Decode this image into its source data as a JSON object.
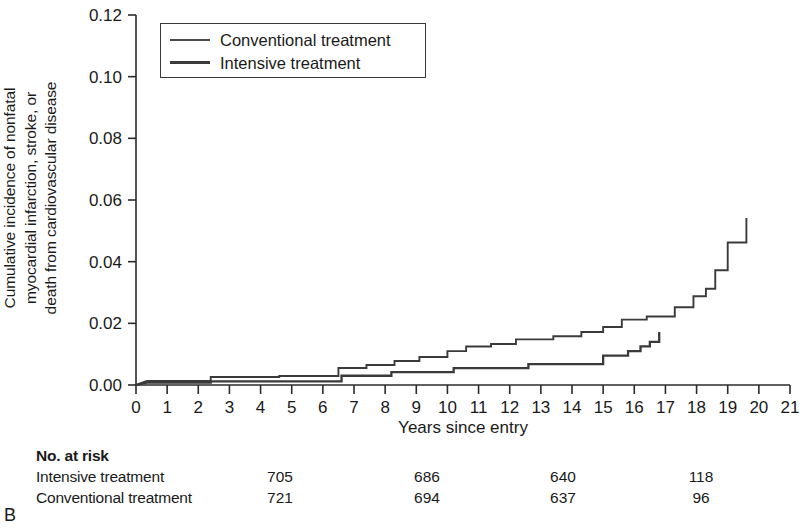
{
  "panel_label": "B",
  "axis": {
    "y_title_lines": [
      "Cumulative incidence of nonfatal",
      "myocardial infarction, stroke, or",
      "death from cardiovascular disease"
    ],
    "x_title": "Years since entry",
    "y_ticks": [
      "0.00",
      "0.02",
      "0.04",
      "0.06",
      "0.08",
      "0.10",
      "0.12"
    ],
    "x_ticks": [
      "0",
      "1",
      "2",
      "3",
      "4",
      "5",
      "6",
      "7",
      "8",
      "9",
      "10",
      "11",
      "12",
      "13",
      "14",
      "15",
      "16",
      "17",
      "18",
      "19",
      "20",
      "21"
    ]
  },
  "legend": {
    "items": [
      {
        "label": "Conventional treatment",
        "style": "thin",
        "color": "#4a4a4a"
      },
      {
        "label": "Intensive treatment",
        "style": "thick",
        "color": "#3a3a3a"
      }
    ]
  },
  "risk_table": {
    "title": "No. at risk",
    "rows": [
      {
        "name": "Intensive treatment",
        "values": [
          "705",
          "686",
          "640",
          "118"
        ]
      },
      {
        "name": "Conventional treatment",
        "values": [
          "721",
          "694",
          "637",
          "96"
        ]
      }
    ],
    "value_x": [
      280,
      427,
      563,
      701
    ]
  },
  "chart_data": {
    "type": "line",
    "subtype": "kaplan-meier-cumulative-incidence-step",
    "title": "",
    "xlabel": "Years since entry",
    "ylabel": "Cumulative incidence of nonfatal myocardial infarction, stroke, or death from cardiovascular disease",
    "xlim": [
      0,
      21
    ],
    "ylim": [
      0.0,
      0.12
    ],
    "xticks": [
      0,
      1,
      2,
      3,
      4,
      5,
      6,
      7,
      8,
      9,
      10,
      11,
      12,
      13,
      14,
      15,
      16,
      17,
      18,
      19,
      20,
      21
    ],
    "yticks": [
      0.0,
      0.02,
      0.04,
      0.06,
      0.08,
      0.1,
      0.12
    ],
    "grid": false,
    "legend_position": "top-left-inside-box",
    "series": [
      {
        "name": "Conventional treatment",
        "color": "#4a4a4a",
        "linewidth": 1.9,
        "points": [
          [
            0.0,
            0.0
          ],
          [
            0.35,
            0.0013
          ],
          [
            2.4,
            0.0013
          ],
          [
            2.4,
            0.0026
          ],
          [
            4.6,
            0.0026
          ],
          [
            4.6,
            0.0029
          ],
          [
            6.5,
            0.0029
          ],
          [
            6.5,
            0.0055
          ],
          [
            7.4,
            0.0055
          ],
          [
            7.4,
            0.0065
          ],
          [
            8.3,
            0.0065
          ],
          [
            8.3,
            0.0078
          ],
          [
            9.1,
            0.0078
          ],
          [
            9.1,
            0.0091
          ],
          [
            10.0,
            0.0091
          ],
          [
            10.0,
            0.011
          ],
          [
            10.6,
            0.011
          ],
          [
            10.6,
            0.0125
          ],
          [
            11.4,
            0.0125
          ],
          [
            11.4,
            0.0133
          ],
          [
            12.2,
            0.0133
          ],
          [
            12.2,
            0.0148
          ],
          [
            13.4,
            0.0148
          ],
          [
            13.4,
            0.0158
          ],
          [
            14.3,
            0.0158
          ],
          [
            14.3,
            0.0172
          ],
          [
            15.0,
            0.0172
          ],
          [
            15.0,
            0.0188
          ],
          [
            15.6,
            0.0188
          ],
          [
            15.6,
            0.0212
          ],
          [
            16.4,
            0.0212
          ],
          [
            16.4,
            0.0222
          ],
          [
            17.3,
            0.0222
          ],
          [
            17.3,
            0.0252
          ],
          [
            17.9,
            0.0252
          ],
          [
            17.9,
            0.0288
          ],
          [
            18.3,
            0.0288
          ],
          [
            18.3,
            0.0312
          ],
          [
            18.6,
            0.0312
          ],
          [
            18.6,
            0.0372
          ],
          [
            19.0,
            0.0372
          ],
          [
            19.0,
            0.0462
          ],
          [
            19.6,
            0.0462
          ],
          [
            19.6,
            0.0542
          ]
        ]
      },
      {
        "name": "Intensive treatment",
        "color": "#3a3a3a",
        "linewidth": 2.3,
        "points": [
          [
            0.0,
            0.0
          ],
          [
            0.35,
            0.0008
          ],
          [
            2.4,
            0.0008
          ],
          [
            2.4,
            0.0012
          ],
          [
            6.6,
            0.0012
          ],
          [
            6.6,
            0.003
          ],
          [
            8.2,
            0.003
          ],
          [
            8.2,
            0.0042
          ],
          [
            10.2,
            0.0042
          ],
          [
            10.2,
            0.0055
          ],
          [
            12.6,
            0.0055
          ],
          [
            12.6,
            0.0068
          ],
          [
            15.0,
            0.0068
          ],
          [
            15.0,
            0.0095
          ],
          [
            15.8,
            0.0095
          ],
          [
            15.8,
            0.011
          ],
          [
            16.2,
            0.011
          ],
          [
            16.2,
            0.0125
          ],
          [
            16.5,
            0.0125
          ],
          [
            16.5,
            0.014
          ],
          [
            16.8,
            0.014
          ],
          [
            16.8,
            0.0172
          ]
        ]
      }
    ]
  }
}
